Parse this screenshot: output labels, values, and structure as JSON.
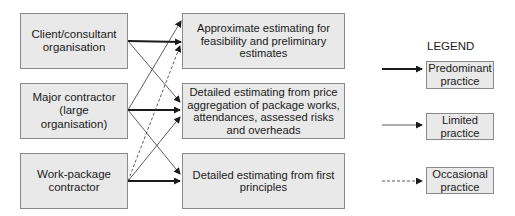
{
  "sources": [
    {
      "id": "client",
      "label": "Client/consultant organisation"
    },
    {
      "id": "major",
      "label": "Major contractor (large organisation)"
    },
    {
      "id": "workpackage",
      "label": "Work-package contractor"
    }
  ],
  "targets": [
    {
      "id": "approx",
      "label": "Approximate estimating for feasibility and preliminary estimates"
    },
    {
      "id": "aggregation",
      "label": "Detailed estimating from price aggregation of package works, attendances, assessed risks and overheads"
    },
    {
      "id": "firstprinciples",
      "label": "Detailed estimating from first principles"
    }
  ],
  "connections": [
    {
      "from": "client",
      "to": "approx",
      "type": "predominant"
    },
    {
      "from": "client",
      "to": "aggregation",
      "type": "limited"
    },
    {
      "from": "major",
      "to": "approx",
      "type": "limited"
    },
    {
      "from": "major",
      "to": "aggregation",
      "type": "predominant"
    },
    {
      "from": "major",
      "to": "firstprinciples",
      "type": "limited"
    },
    {
      "from": "workpackage",
      "to": "approx",
      "type": "occasional"
    },
    {
      "from": "workpackage",
      "to": "aggregation",
      "type": "limited"
    },
    {
      "from": "workpackage",
      "to": "firstprinciples",
      "type": "predominant"
    }
  ],
  "legend": {
    "title": "LEGEND",
    "items": [
      {
        "type": "predominant",
        "label": "Predominant practice",
        "line": "thick-solid"
      },
      {
        "type": "limited",
        "label": "Limited practice",
        "line": "thin-solid"
      },
      {
        "type": "occasional",
        "label": "Occasional practice",
        "line": "dashed"
      }
    ]
  },
  "colors": {
    "box_fill": "#e9e9e9",
    "box_border": "#8a8a8a",
    "arrow": "#1a1a1a"
  }
}
